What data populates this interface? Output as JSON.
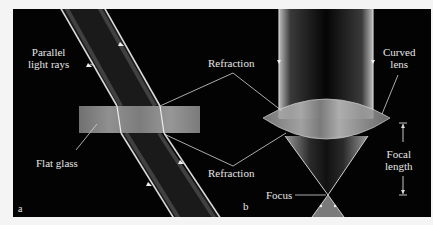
{
  "panels": {
    "a": {
      "letter": "a",
      "labels": {
        "parallel_line1": "Parallel",
        "parallel_line2": "light rays",
        "flat_glass": "Flat glass"
      }
    },
    "b": {
      "letter": "b",
      "labels": {
        "curved_line1": "Curved",
        "curved_line2": "lens",
        "focal_line1": "Focal",
        "focal_line2": "length",
        "focus": "Focus"
      }
    },
    "shared": {
      "refraction_top": "Refraction",
      "refraction_bottom": "Refraction"
    }
  },
  "colors": {
    "background": "#030303",
    "frame": "#f4f4f4",
    "beam_edge": "#d9d9d9",
    "glass": "#9a9a9a",
    "text": "#e6e6e6"
  }
}
